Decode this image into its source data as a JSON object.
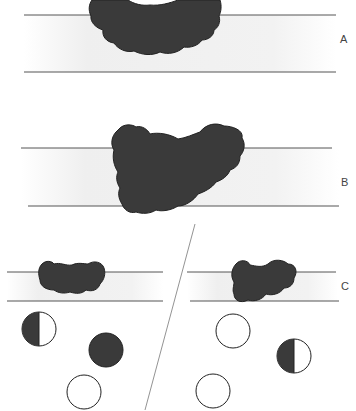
{
  "diagram": {
    "panels": [
      {
        "id": "A",
        "label": "A",
        "description": "Dark irregular mass sitting between two horizontal lines, protruding above the upper line"
      },
      {
        "id": "B",
        "label": "B",
        "description": "Larger dark irregular mass spanning and extending beyond both horizontal lines"
      },
      {
        "id": "C",
        "label": "C",
        "description": "Two sub-panels separated by a diagonal line, each with a mass and three circles"
      }
    ],
    "panel_c": {
      "left": {
        "circles": [
          {
            "fill": "half-left-dark"
          },
          {
            "fill": "full-dark"
          },
          {
            "fill": "empty"
          }
        ]
      },
      "right": {
        "circles": [
          {
            "fill": "empty"
          },
          {
            "fill": "half-left-dark"
          },
          {
            "fill": "empty"
          }
        ]
      }
    },
    "colors": {
      "mass": "#3a3a3a",
      "line": "#555555",
      "band": "#eeeeee",
      "background": "#ffffff"
    }
  }
}
